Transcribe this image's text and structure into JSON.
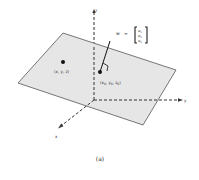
{
  "figure": {
    "caption": "(a)",
    "axes": {
      "x_label": "x",
      "y_label": "y",
      "z_label": "z"
    },
    "points": [
      {
        "label": "(x, y, z)"
      },
      {
        "label": "(x0, y0, z0)",
        "base": "(x",
        "sub0": "0",
        "mid1": ", y",
        "sub1": "0",
        "mid2": ", z",
        "sub2": "0",
        "end": ")"
      }
    ],
    "normal_vector": {
      "name": "w",
      "equals": "=",
      "components": [
        "w1",
        "w2",
        "w3"
      ],
      "comp_base": "w",
      "comp_subs": [
        "1",
        "2",
        "3"
      ]
    },
    "colors": {
      "plane_fill": "#e6e6e6",
      "plane_stroke": "#555555",
      "axis": "#333333",
      "point": "#111111"
    }
  }
}
